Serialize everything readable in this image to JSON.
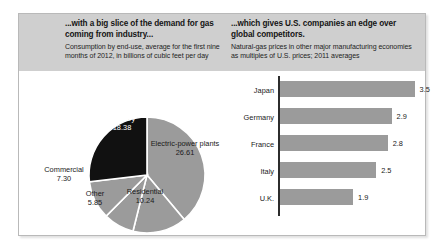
{
  "panels": {
    "left": {
      "title": "...with a big slice of the demand for gas coming from industry...",
      "subtitle": "Consumption by end-use, average for the first nine months of 2012, in billions of cubic feet per day"
    },
    "right": {
      "title": "...which gives U.S. companies an edge over global competitors.",
      "subtitle": "Natural-gas prices in other major manufacturing economies as multiples of U.S. prices; 2011 averages"
    }
  },
  "chart_data": [
    {
      "type": "pie",
      "title": "...with a big slice of the demand for gas coming from industry...",
      "subtitle": "Consumption by end-use, average for the first nine months of 2012, in billions of cubic feet per day",
      "unit": "billions of cubic feet per day",
      "categories": [
        "Electric-power plants",
        "Residential",
        "Other",
        "Commercial",
        "Industry"
      ],
      "values": [
        26.61,
        10.24,
        5.85,
        7.3,
        18.38
      ],
      "labels": [
        {
          "name": "Electric-power plants",
          "value": "26.61",
          "color": "#9b9b9b"
        },
        {
          "name": "Residential",
          "value": "10.24",
          "color": "#9b9b9b"
        },
        {
          "name": "Other",
          "value": "5.85",
          "color": "#9b9b9b"
        },
        {
          "name": "Commercial",
          "value": "7.30",
          "color": "#9b9b9b"
        },
        {
          "name": "Industry",
          "value": "18.38",
          "color": "#111111"
        }
      ]
    },
    {
      "type": "bar",
      "orientation": "horizontal",
      "title": "...which gives U.S. companies an edge over global competitors.",
      "subtitle": "Natural-gas prices in other major manufacturing economies as multiples of U.S. prices; 2011 averages",
      "categories": [
        "Japan",
        "Germany",
        "France",
        "Italy",
        "U.K."
      ],
      "values": [
        3.5,
        2.9,
        2.8,
        2.5,
        1.9
      ],
      "value_labels": [
        "3.5",
        "2.9",
        "2.8",
        "2.5",
        "1.9"
      ],
      "xlabel": "",
      "ylabel": "",
      "xlim": [
        0,
        3.9
      ],
      "grid": false,
      "legend": "none",
      "bar_color": "#9b9b9b"
    }
  ],
  "colors": {
    "band": "#cfcfcf",
    "gray_slice": "#9b9b9b",
    "dark_slice": "#111111",
    "axis": "#2c2c2c",
    "frame": "#b9b9b9"
  }
}
